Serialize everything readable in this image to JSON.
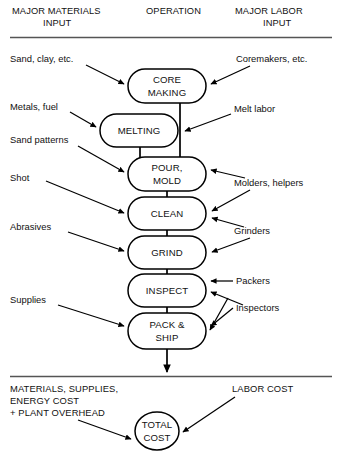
{
  "diagram": {
    "type": "flowchart",
    "title_columns": [
      {
        "id": "materials",
        "line1": "MAJOR MATERIALS",
        "line2": "INPUT"
      },
      {
        "id": "operation",
        "line1": "OPERATION",
        "line2": ""
      },
      {
        "id": "labor",
        "line1": "MAJOR LABOR",
        "line2": "INPUT"
      }
    ],
    "operations": [
      {
        "id": "core-making",
        "line1": "CORE",
        "line2": "MAKING"
      },
      {
        "id": "melting",
        "line1": "MELTING",
        "line2": ""
      },
      {
        "id": "pour-mold",
        "line1": "POUR,",
        "line2": "MOLD"
      },
      {
        "id": "clean",
        "line1": "CLEAN",
        "line2": ""
      },
      {
        "id": "grind",
        "line1": "GRIND",
        "line2": ""
      },
      {
        "id": "inspect",
        "line1": "INSPECT",
        "line2": ""
      },
      {
        "id": "pack-ship",
        "line1": "PACK &",
        "line2": "SHIP"
      }
    ],
    "material_inputs": [
      {
        "id": "sand-clay",
        "label": "Sand, clay, etc.",
        "target": "core-making"
      },
      {
        "id": "metals-fuel",
        "label": "Metals, fuel",
        "target": "melting"
      },
      {
        "id": "sand-patterns",
        "label": "Sand patterns",
        "target": "pour-mold"
      },
      {
        "id": "shot",
        "label": "Shot",
        "target": "clean"
      },
      {
        "id": "abrasives",
        "label": "Abrasives",
        "target": "grind"
      },
      {
        "id": "supplies",
        "label": "Supplies",
        "target": "pack-ship"
      }
    ],
    "labor_inputs": [
      {
        "id": "coremakers",
        "label": "Coremakers, etc.",
        "target": "core-making"
      },
      {
        "id": "melt-labor",
        "label": "Melt labor",
        "target": "melting"
      },
      {
        "id": "molders-helpers",
        "label": "Molders, helpers",
        "target": "pour-mold, clean"
      },
      {
        "id": "grinders",
        "label": "Grinders",
        "target": "clean, grind"
      },
      {
        "id": "packers",
        "label": "Packers",
        "target": "inspect, pack-ship"
      },
      {
        "id": "inspectors",
        "label": "Inspectors",
        "target": "inspect, pack-ship"
      }
    ],
    "cost_summary": {
      "materials_cost_line1": "MATERIALS, SUPPLIES,",
      "materials_cost_line2": "ENERGY COST",
      "materials_cost_line3": "+ PLANT OVERHEAD",
      "labor_cost": "LABOR COST",
      "total_line1": "TOTAL",
      "total_line2": "COST"
    }
  }
}
